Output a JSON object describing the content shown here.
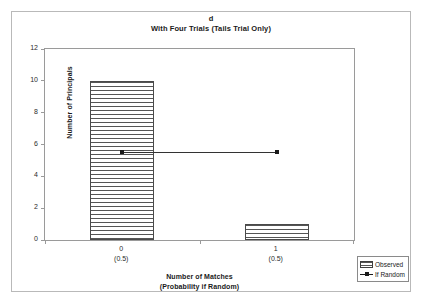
{
  "chart_data": {
    "type": "bar",
    "title": "d",
    "subtitle": "With Four Trials (Tails Trial Only)",
    "xlabel": "Number of Matches",
    "xlabel_line2": "(Probability if Random)",
    "ylabel": "Number of Principals",
    "categories": [
      "0",
      "1"
    ],
    "category_sublabels": [
      "(0.5)",
      "(0.5)"
    ],
    "ylim": [
      0,
      12
    ],
    "ytick_labels": [
      "0",
      "2",
      "4",
      "6",
      "8",
      "10",
      "12"
    ],
    "ytick_values": [
      0,
      2,
      4,
      6,
      8,
      10,
      12
    ],
    "grid": false,
    "legend_position": "bottom-right",
    "series": [
      {
        "name": "Observed",
        "type": "bar",
        "values": [
          10,
          1
        ]
      },
      {
        "name": "If Random",
        "type": "line",
        "values": [
          5.5,
          5.5
        ]
      }
    ]
  },
  "legend": {
    "items": [
      {
        "label": "Observed",
        "marker": "hatched-bar-swatch"
      },
      {
        "label": "If Random",
        "marker": "line-with-square-marker"
      }
    ]
  }
}
